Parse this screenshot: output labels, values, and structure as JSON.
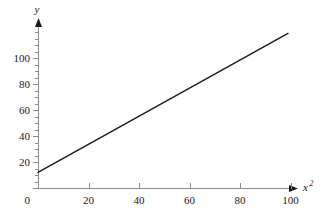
{
  "chart_data": {
    "type": "line",
    "title": "",
    "subtitle": "",
    "xlabel": "x",
    "xlabel_superscript": "2",
    "ylabel": "y",
    "xlim": [
      0,
      108
    ],
    "ylim": [
      0,
      122
    ],
    "x_ticks": [
      0,
      20,
      40,
      60,
      80,
      100
    ],
    "y_ticks": [
      0,
      20,
      40,
      60,
      80,
      100
    ],
    "x_tick_labels": [
      "0",
      "20",
      "40",
      "60",
      "80",
      "100"
    ],
    "y_tick_labels": [
      "0",
      "20",
      "40",
      "60",
      "80",
      "100"
    ],
    "x_minor_tick_interval": 5,
    "y_minor_tick_interval": 5,
    "grid": false,
    "legend": false,
    "axis_arrows": true,
    "origin_label": "0",
    "series": [
      {
        "name": "linear fit",
        "x": [
          0,
          99
        ],
        "y": [
          12,
          119
        ],
        "slope": 1.08,
        "intercept": 12,
        "color": "#1c1c1c"
      }
    ],
    "colors": {
      "line": "#1c1c1c",
      "axis": "#8c8c8c",
      "text": "#1a1a1a",
      "background": "#ffffff"
    }
  },
  "figure": {
    "name": "linearized-plot",
    "plot_area": {
      "x_origin_px": 38,
      "y_origin_px": 188,
      "px_per_20_x": 50.5,
      "px_per_20_y": 26
    }
  }
}
